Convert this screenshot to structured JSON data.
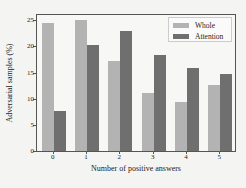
{
  "chart_data": {
    "type": "bar",
    "title": "",
    "xlabel": "Number of positive answers",
    "ylabel": "Adversarial samples (%)",
    "categories": [
      "0",
      "1",
      "2",
      "3",
      "4",
      "5"
    ],
    "series": [
      {
        "name": "Whole",
        "color": "#b3b3b3",
        "values": [
          24.4,
          25.1,
          17.3,
          11.1,
          9.3,
          12.7
        ]
      },
      {
        "name": "Attention",
        "color": "#6f6f6f",
        "values": [
          7.6,
          20.3,
          22.9,
          18.4,
          15.9,
          14.8
        ]
      }
    ],
    "yticks": [
      "0",
      "5",
      "10",
      "15",
      "20",
      "25"
    ],
    "ylim": [
      0,
      26.2
    ],
    "grid": false,
    "legend_position": "upper right"
  }
}
